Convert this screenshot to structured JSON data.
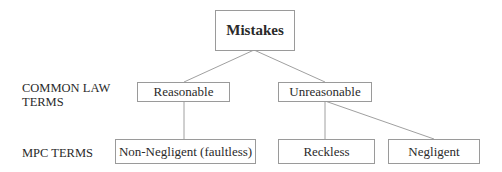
{
  "diagram": {
    "root": {
      "label": "Mistakes"
    },
    "row_labels": {
      "common_law_line1": "COMMON LAW",
      "common_law_line2": "TERMS",
      "mpc": "MPC TERMS"
    },
    "common_law_nodes": [
      {
        "label": "Reasonable"
      },
      {
        "label": "Unreasonable"
      }
    ],
    "mpc_nodes": [
      {
        "label": "Non-Negligent (faultless)",
        "parent": "Reasonable"
      },
      {
        "label": "Reckless",
        "parent": "Unreasonable"
      },
      {
        "label": "Negligent",
        "parent": "Unreasonable"
      }
    ],
    "colors": {
      "line": "#9a9a9a",
      "border": "#9a9a9a",
      "text": "#2a2a2a"
    }
  }
}
